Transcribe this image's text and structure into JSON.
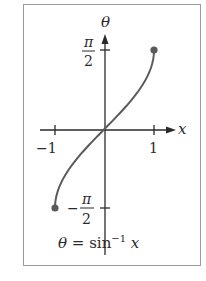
{
  "figure": {
    "caption_theta": "θ",
    "caption_eq": " = sin",
    "caption_exp": "−1",
    "caption_x": " x",
    "axes": {
      "x_label": "x",
      "y_label": "θ",
      "x_ticks": [
        {
          "value": -1,
          "label": "−1"
        },
        {
          "value": 1,
          "label": "1"
        }
      ],
      "y_ticks": [
        {
          "value": "π/2",
          "num": "π",
          "den": "2",
          "sign": ""
        },
        {
          "value": "-π/2",
          "num": "π",
          "den": "2",
          "sign": "−"
        }
      ]
    },
    "curve": {
      "function": "arcsin",
      "domain": [
        -1,
        1
      ],
      "range": [
        "-π/2",
        "π/2"
      ],
      "endpoints": [
        {
          "x": -1,
          "y": "-π/2",
          "style": "closed-dot"
        },
        {
          "x": 1,
          "y": "π/2",
          "style": "closed-dot"
        }
      ]
    },
    "colors": {
      "curve": "#5a5a5a",
      "axes": "#2a2a2a",
      "frame": "#9a9a9a"
    }
  }
}
